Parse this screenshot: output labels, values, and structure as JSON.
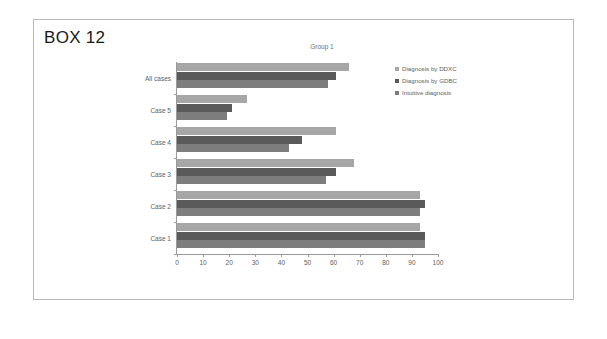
{
  "box": {
    "title": "BOX 12"
  },
  "chart_data": {
    "type": "bar",
    "orientation": "horizontal",
    "title": "Group 1",
    "subtitle": "",
    "xlabel": "",
    "ylabel": "",
    "xlim": [
      0,
      100
    ],
    "xticks": [
      0,
      10,
      20,
      30,
      40,
      50,
      60,
      70,
      80,
      90,
      100
    ],
    "grid": false,
    "legend_position": "right",
    "categories": [
      "All cases",
      "Case 5",
      "Case 4",
      "Case 3",
      "Case 2",
      "Case 1"
    ],
    "series": [
      {
        "name": "Diagnosis by DDXC",
        "color": "#a6a6a6",
        "values": [
          66,
          27,
          61,
          68,
          93,
          93
        ]
      },
      {
        "name": "Diagnosis by GDBC",
        "color": "#5a5a5a",
        "values": [
          61,
          21,
          48,
          61,
          95,
          95
        ]
      },
      {
        "name": "Intuitive diagnosis",
        "color": "#7d7d7d",
        "values": [
          58,
          19,
          43,
          57,
          93,
          95
        ]
      }
    ]
  }
}
